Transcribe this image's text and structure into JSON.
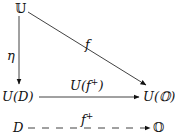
{
  "diagram": {
    "type": "commutative-diagram",
    "nodes": {
      "top": "𝕌",
      "bottom_left": "U(D)",
      "bottom_right": "U(𝕆)",
      "row2_left": "D",
      "row2_right": "𝕆"
    },
    "arrows": {
      "vertical": {
        "from": "𝕌",
        "to": "U(D)",
        "label": "η",
        "style": "solid"
      },
      "diagonal": {
        "from": "𝕌",
        "to": "U(𝕆)",
        "label": "f",
        "style": "solid"
      },
      "horizontal": {
        "from": "U(D)",
        "to": "U(𝕆)",
        "label_base": "U(f",
        "label_sup": "+",
        "label_close": ")",
        "style": "solid"
      },
      "dashed": {
        "from": "D",
        "to": "𝕆",
        "label_base": "f",
        "label_sup": "+",
        "style": "dashed"
      }
    },
    "colors": {
      "ink": "#111111",
      "background": "#ffffff"
    }
  }
}
